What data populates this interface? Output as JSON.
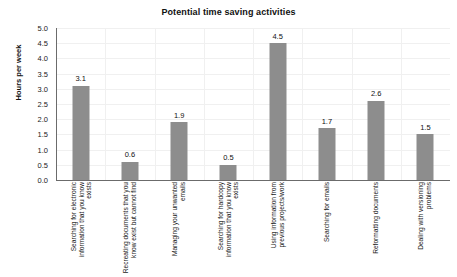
{
  "chart_data": {
    "type": "bar",
    "title": "Potential time saving activities",
    "xlabel": "",
    "ylabel": "Hours per week",
    "ylim": [
      0,
      5
    ],
    "ytick_step": 0.5,
    "ytick_labels": [
      "0.0",
      "0.5",
      "1.0",
      "1.5",
      "2.0",
      "2.5",
      "3.0",
      "3.5",
      "4.0",
      "4.5",
      "5.0"
    ],
    "grid": true,
    "legend": false,
    "bar_color": "#8d8d8d",
    "categories": [
      "Searching for electronic information that you know exists",
      "Recreating documents that you know exist but cannot find",
      "Managing your unwanted emails",
      "Searching for hardcopy information that you know exists",
      "Using information from previous projects/work",
      "Searching for emails",
      "Reformatting documents",
      "Dealing with versioning problems"
    ],
    "values": [
      3.1,
      0.6,
      1.9,
      0.5,
      4.5,
      1.7,
      2.6,
      1.5
    ],
    "value_labels": [
      "3.1",
      "0.6",
      "1.9",
      "0.5",
      "4.5",
      "1.7",
      "2.6",
      "1.5"
    ]
  }
}
